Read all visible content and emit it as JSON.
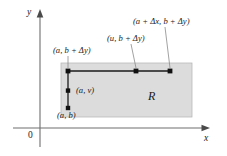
{
  "figure": {
    "colors": {
      "region_fill": "#dcdcdc",
      "region_stroke": "#b8b8b8",
      "axis": "#6e6e6e",
      "line": "#1a1a1a",
      "point": "#111111",
      "leader": "#7a7a7a",
      "text": "#1a1a1a"
    }
  },
  "axes": {
    "x_label": "x",
    "y_label": "y",
    "origin_label": "0"
  },
  "region": {
    "label": "R"
  },
  "points": [
    {
      "name": "corner-bottom-left",
      "label": "(a, b)"
    },
    {
      "name": "interior-left",
      "label": "(a, v)"
    },
    {
      "name": "corner-top-left",
      "label": "(a, b + Δy)"
    },
    {
      "name": "top-middle",
      "label": "(u, b + Δy)"
    },
    {
      "name": "corner-top-right",
      "label": "(a + Δx, b + Δy)"
    }
  ]
}
